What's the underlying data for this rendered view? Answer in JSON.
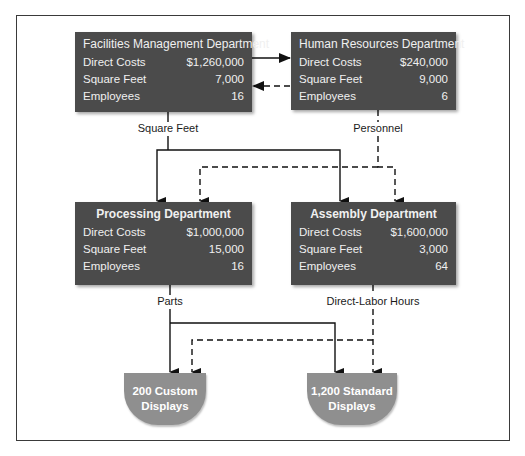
{
  "departments": {
    "facilities": {
      "title": "Facilities Management Department",
      "rows": [
        {
          "label": "Direct Costs",
          "value": "$1,260,000"
        },
        {
          "label": "Square Feet",
          "value": "7,000"
        },
        {
          "label": "Employees",
          "value": "16"
        }
      ]
    },
    "hr": {
      "title": "Human Resources Department",
      "rows": [
        {
          "label": "Direct Costs",
          "value": "$240,000"
        },
        {
          "label": "Square Feet",
          "value": "9,000"
        },
        {
          "label": "Employees",
          "value": "6"
        }
      ]
    },
    "processing": {
      "title": "Processing Department",
      "rows": [
        {
          "label": "Direct Costs",
          "value": "$1,000,000"
        },
        {
          "label": "Square Feet",
          "value": "15,000"
        },
        {
          "label": "Employees",
          "value": "16"
        }
      ]
    },
    "assembly": {
      "title": "Assembly Department",
      "rows": [
        {
          "label": "Direct Costs",
          "value": "$1,600,000"
        },
        {
          "label": "Square Feet",
          "value": "3,000"
        },
        {
          "label": "Employees",
          "value": "64"
        }
      ]
    }
  },
  "allocation_bases": {
    "facilities": "Square Feet",
    "hr": "Personnel",
    "processing": "Parts",
    "assembly": "Direct-Labor Hours"
  },
  "products": {
    "custom": {
      "line1": "200 Custom",
      "line2": "Displays"
    },
    "standard": {
      "line1": "1,200 Standard",
      "line2": "Displays"
    }
  },
  "colors": {
    "department_box": "#4b4b4b",
    "product_box": "#8f8f8f",
    "line": "#111111"
  }
}
